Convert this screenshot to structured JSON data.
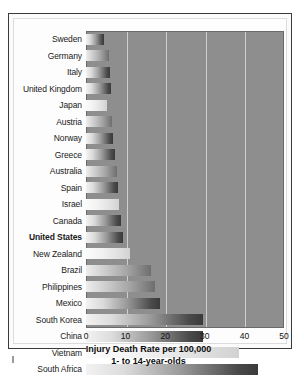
{
  "chart_data": {
    "type": "bar",
    "orientation": "horizontal",
    "title": "",
    "xlabel": "Injury Death Rate per 100,000",
    "xlabel_line2": "1- to 14-year-olds",
    "ylabel": "",
    "xlim": [
      0,
      50
    ],
    "xticks": [
      0,
      10,
      20,
      30,
      40,
      50
    ],
    "grid": true,
    "legend": "none",
    "highlighted_category": "United States",
    "categories": [
      "Sweden",
      "Germany",
      "Italy",
      "United Kingdom",
      "Japan",
      "Austria",
      "Norway",
      "Greece",
      "Australia",
      "Spain",
      "Israel",
      "Canada",
      "United States",
      "New Zealand",
      "Brazil",
      "Philippines",
      "Mexico",
      "South Korea",
      "China",
      "Vietnam",
      "South Africa"
    ],
    "values": [
      4.6,
      5.7,
      6.1,
      6.3,
      5.2,
      6.6,
      6.9,
      7.4,
      7.8,
      8.0,
      8.3,
      8.8,
      9.4,
      11.0,
      16.5,
      17.3,
      18.8,
      29.5,
      29.6,
      38.6,
      43.4
    ],
    "bar_shades": [
      "dark",
      "mid",
      "dark",
      "dark",
      "light",
      "mid",
      "dark",
      "dark",
      "mid",
      "dark",
      "light",
      "dark",
      "dark",
      "light",
      "mid",
      "mid",
      "dark",
      "dark",
      "dark",
      "light",
      "dark"
    ]
  },
  "footnote_mark": ""
}
